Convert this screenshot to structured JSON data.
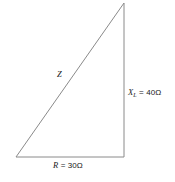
{
  "diagram": {
    "type": "impedance-triangle",
    "background_color": "#ffffff",
    "stroke_color": "#8a8a8a",
    "text_color": "#1a1a1a",
    "geometry": {
      "origin_x": 16,
      "origin_y": 157,
      "corner_x": 124,
      "corner_y": 157,
      "apex_x": 124,
      "apex_y": 3
    },
    "labels": {
      "hypotenuse": {
        "symbol": "Z"
      },
      "vertical_leg": {
        "symbol": "X",
        "subscript": "L",
        "equals": "=",
        "value": "40Ω"
      },
      "horizontal_leg": {
        "symbol": "R",
        "equals": "=",
        "value": "30Ω"
      }
    }
  }
}
